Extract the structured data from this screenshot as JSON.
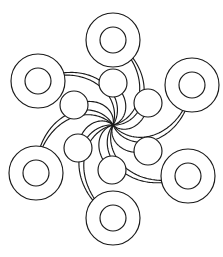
{
  "figure": {
    "background_color": "#ffffff",
    "stroke_color": "#1a1a1a",
    "stroke_width": 1.15,
    "width": 223,
    "height": 257
  },
  "chart_data": {
    "type": "diagram",
    "subtype": "radial-pinwheel-node-link",
    "xlabel": "",
    "ylabel": "",
    "grid": false,
    "legend": null,
    "annotations": [],
    "center": {
      "x": 113,
      "y": 125,
      "label": "hub-convergence-point"
    },
    "symmetry": {
      "order": 6,
      "rotation_step_degrees": 60,
      "handedness": "counter-clockwise"
    },
    "outer_rings": [
      {
        "id": "ring-top",
        "cx": 113,
        "cy": 40,
        "r_outer": 27,
        "r_inner": 13,
        "angle_degrees": 90
      },
      {
        "id": "ring-upper-right",
        "cx": 192,
        "cy": 85,
        "r_outer": 27,
        "r_inner": 13,
        "angle_degrees": 30
      },
      {
        "id": "ring-lower-right",
        "cx": 188,
        "cy": 176,
        "r_outer": 27,
        "r_inner": 13,
        "angle_degrees": 330
      },
      {
        "id": "ring-bottom",
        "cx": 113,
        "cy": 218,
        "r_outer": 27,
        "r_inner": 13,
        "angle_degrees": 270
      },
      {
        "id": "ring-lower-left",
        "cx": 36,
        "cy": 173,
        "r_outer": 27,
        "r_inner": 13,
        "angle_degrees": 210
      },
      {
        "id": "ring-upper-left",
        "cx": 38,
        "cy": 81,
        "r_outer": 27,
        "r_inner": 13,
        "angle_degrees": 150
      }
    ],
    "inner_nodes": [
      {
        "id": "node-upper-mid",
        "cx": 113,
        "cy": 83,
        "r": 14
      },
      {
        "id": "node-right-upper",
        "cx": 148,
        "cy": 103,
        "r": 14
      },
      {
        "id": "node-right-lower",
        "cx": 148,
        "cy": 151,
        "r": 14
      },
      {
        "id": "node-lower-mid",
        "cx": 112,
        "cy": 170,
        "r": 14
      },
      {
        "id": "node-left-lower",
        "cx": 78,
        "cy": 148,
        "r": 14
      },
      {
        "id": "node-left-upper",
        "cx": 74,
        "cy": 105,
        "r": 14
      }
    ],
    "spiral_arms": 6,
    "curves_per_arm": 2
  }
}
